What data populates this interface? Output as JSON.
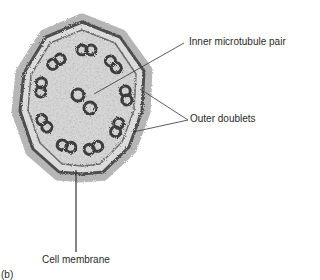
{
  "figure": {
    "panel_label": "(b)",
    "labels": {
      "inner_pair": "Inner microtubule pair",
      "outer_doublets": "Outer doublets",
      "cell_membrane": "Cell membrane"
    },
    "colors": {
      "background": "#ffffff",
      "membrane": "#5a5a5a",
      "interior": "#d9d9d9",
      "microtubule": "#3c3c3c",
      "leader_line": "#333333",
      "text": "#2a2a2a"
    },
    "outer_doublet_count": 9,
    "inner_pair_count": 2
  }
}
